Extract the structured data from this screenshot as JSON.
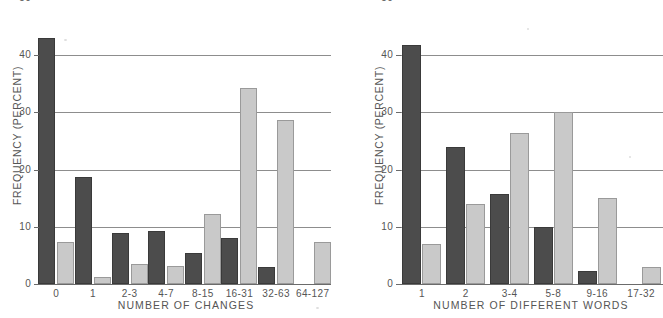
{
  "figure": {
    "background": "#ffffff",
    "dark_color": "#4c4c4c",
    "light_color": "#c9c9c9",
    "gridline_color": "#8d8d8d",
    "text_color": "#555555"
  },
  "chart_data": [
    {
      "type": "bar",
      "panel": "left",
      "title": "",
      "xlabel": "NUMBER OF CHANGES",
      "ylabel": "FREQUENCY (PERCENT)",
      "categories": [
        "0",
        "1",
        "2-3",
        "4-7",
        "8-15",
        "16-31",
        "32-63",
        "64-127"
      ],
      "ylim": [
        0,
        50
      ],
      "yticks": [
        0,
        10,
        20,
        30,
        40,
        50
      ],
      "ytick_labels": [
        "0",
        "10",
        "20",
        "30",
        "40",
        "50"
      ],
      "grid": true,
      "legend": "none",
      "series": [
        {
          "name": "dark",
          "color": "#4c4c4c",
          "values": [
            43.0,
            18.7,
            8.9,
            9.2,
            5.5,
            8.0,
            3.0,
            0.0
          ]
        },
        {
          "name": "light",
          "color": "#c9c9c9",
          "values": [
            7.4,
            1.3,
            3.5,
            3.1,
            12.3,
            34.2,
            28.6,
            7.4
          ]
        }
      ]
    },
    {
      "type": "bar",
      "panel": "right",
      "title": "",
      "xlabel": "NUMBER OF DIFFERENT WORDS",
      "ylabel": "FREQUENCY (PERCENT)",
      "categories": [
        "1",
        "2",
        "3-4",
        "5-8",
        "9-16",
        "17-32"
      ],
      "ylim": [
        0,
        50
      ],
      "yticks": [
        0,
        10,
        20,
        30,
        40,
        50
      ],
      "ytick_labels": [
        "0",
        "10",
        "20",
        "30",
        "40",
        "50"
      ],
      "grid": true,
      "legend": "none",
      "series": [
        {
          "name": "dark",
          "color": "#4c4c4c",
          "values": [
            41.8,
            24.0,
            15.8,
            10.0,
            2.2,
            0.0
          ]
        },
        {
          "name": "light",
          "color": "#c9c9c9",
          "values": [
            7.0,
            14.0,
            26.3,
            30.0,
            15.0,
            3.0
          ]
        }
      ]
    }
  ],
  "left_chart": {
    "ylabel": "FREQUENCY (PERCENT)",
    "xlabel": "NUMBER OF CHANGES",
    "ytick_labels": [
      "50",
      "40",
      "30",
      "20",
      "10",
      "0"
    ],
    "xtick_labels": [
      "0",
      "1",
      "2-3",
      "4-7",
      "8-15",
      "16-31",
      "32-63",
      "64-127"
    ]
  },
  "right_chart": {
    "ylabel": "FREQUENCY (PERCENT)",
    "xlabel": "NUMBER OF DIFFERENT WORDS",
    "ytick_labels": [
      "50",
      "40",
      "30",
      "20",
      "10",
      "0"
    ],
    "xtick_labels": [
      "1",
      "2",
      "3-4",
      "5-8",
      "9-16",
      "17-32"
    ]
  }
}
